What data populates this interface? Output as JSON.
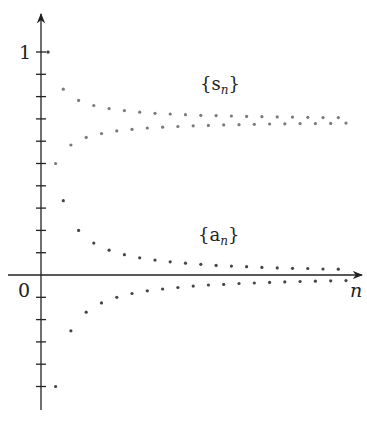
{
  "chart_data": {
    "type": "scatter",
    "title": "",
    "xlabel": "n",
    "ylabel": "",
    "y_tick_labels": [
      {
        "value": 1,
        "label": "1"
      },
      {
        "value": 0,
        "label": "0"
      }
    ],
    "y_tick_step": 0.1,
    "ylim": [
      -0.6,
      1.1
    ],
    "xlim": [
      0,
      42
    ],
    "grid": false,
    "legend": "none",
    "annotations": [
      {
        "text": "{s_n}",
        "base": "s",
        "sub": "n",
        "x": 21,
        "y": 0.84
      },
      {
        "text": "{a_n}",
        "base": "a",
        "sub": "n",
        "x": 21,
        "y": 0.16
      }
    ],
    "series": [
      {
        "name": "s_n",
        "color": "#7a7a7a",
        "x": [
          1,
          2,
          3,
          4,
          5,
          6,
          7,
          8,
          9,
          10,
          11,
          12,
          13,
          14,
          15,
          16,
          17,
          18,
          19,
          20,
          21,
          22,
          23,
          24,
          25,
          26,
          27,
          28,
          29,
          30,
          31,
          32,
          33,
          34,
          35,
          36,
          37,
          38,
          39,
          40
        ],
        "values": [
          1.0,
          0.5,
          0.833,
          0.583,
          0.783,
          0.617,
          0.76,
          0.634,
          0.746,
          0.646,
          0.737,
          0.653,
          0.73,
          0.659,
          0.725,
          0.663,
          0.722,
          0.666,
          0.719,
          0.669,
          0.716,
          0.671,
          0.715,
          0.673,
          0.713,
          0.674,
          0.711,
          0.676,
          0.71,
          0.677,
          0.709,
          0.678,
          0.708,
          0.679,
          0.707,
          0.679,
          0.706,
          0.68,
          0.706,
          0.681
        ]
      },
      {
        "name": "a_n",
        "color": "#444444",
        "x": [
          1,
          2,
          3,
          4,
          5,
          6,
          7,
          8,
          9,
          10,
          11,
          12,
          13,
          14,
          15,
          16,
          17,
          18,
          19,
          20,
          21,
          22,
          23,
          24,
          25,
          26,
          27,
          28,
          29,
          30,
          31,
          32,
          33,
          34,
          35,
          36,
          37,
          38,
          39,
          40
        ],
        "values": [
          1.0,
          -0.5,
          0.333,
          -0.25,
          0.2,
          -0.167,
          0.143,
          -0.125,
          0.111,
          -0.1,
          0.091,
          -0.083,
          0.077,
          -0.071,
          0.067,
          -0.063,
          0.059,
          -0.056,
          0.053,
          -0.05,
          0.048,
          -0.045,
          0.043,
          -0.042,
          0.04,
          -0.038,
          0.037,
          -0.036,
          0.034,
          -0.033,
          0.032,
          -0.031,
          0.03,
          -0.029,
          0.029,
          -0.028,
          0.027,
          -0.026,
          0.026,
          -0.025
        ]
      }
    ]
  },
  "labels": {
    "y_one": "1",
    "origin": "0",
    "x_axis": "n",
    "s_base": "{s",
    "s_sub": "n",
    "s_close": "}",
    "a_base": "{a",
    "a_sub": "n",
    "a_close": "}"
  }
}
